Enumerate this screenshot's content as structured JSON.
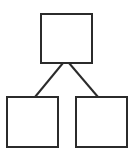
{
  "diagram": {
    "type": "tree",
    "stroke_color": "#2b2b2b",
    "fill_color": "#ffffff",
    "background": "#ffffff",
    "nodes": [
      {
        "id": "root",
        "label": "",
        "x": 41,
        "y": 14,
        "w": 51,
        "h": 49
      },
      {
        "id": "child-left",
        "label": "",
        "x": 7,
        "y": 97,
        "w": 51,
        "h": 50
      },
      {
        "id": "child-right",
        "label": "",
        "x": 76,
        "y": 97,
        "w": 51,
        "h": 50
      }
    ],
    "edges": [
      {
        "from": "root",
        "to": "child-left",
        "x1": 63,
        "y1": 63,
        "x2": 35,
        "y2": 97
      },
      {
        "from": "root",
        "to": "child-right",
        "x1": 69,
        "y1": 63,
        "x2": 98,
        "y2": 97
      }
    ]
  }
}
